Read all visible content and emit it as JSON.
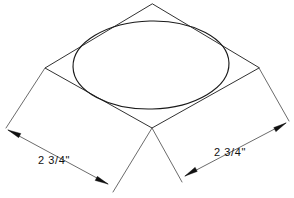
{
  "drawing": {
    "title": "Isometric square with inscribed circle",
    "background_color": "#ffffff",
    "line_color": "#1a1a1a",
    "dimension_line_color": "#3a3a3a",
    "text_color": "#111111",
    "canvas": {
      "width": 294,
      "height": 198
    }
  },
  "shape": {
    "name": "isometric-square",
    "type": "rhombus",
    "vertices": {
      "top": {
        "x": 152,
        "y": 4
      },
      "left": {
        "x": 45,
        "y": 68
      },
      "bottom": {
        "x": 152,
        "y": 128
      },
      "right": {
        "x": 259,
        "y": 68
      }
    },
    "path": "M 152 4 L 45 68 L 152 128 L 259 68 Z"
  },
  "inscribed_circle": {
    "name": "isometric-circle",
    "type": "ellipse",
    "center": {
      "x": 151,
      "y": 65
    },
    "radius_x": 78,
    "radius_y": 44,
    "rotation_deg": -1.5
  },
  "dimensions": [
    {
      "id": "left",
      "label": "2 3/4\"",
      "extension_from": {
        "x": 45,
        "y": 68
      },
      "extension_to": {
        "x": 6,
        "y": 128
      },
      "extension2_from": {
        "x": 152,
        "y": 128
      },
      "extension2_to": {
        "x": 113,
        "y": 192
      },
      "arrow_start": {
        "x": 8,
        "y": 130
      },
      "arrow_end": {
        "x": 108,
        "y": 184
      },
      "text_position": {
        "x": 38,
        "y": 164
      }
    },
    {
      "id": "right",
      "label": "2 3/4\"",
      "extension_from": {
        "x": 259,
        "y": 68
      },
      "extension_to": {
        "x": 289,
        "y": 121
      },
      "extension2_from": {
        "x": 152,
        "y": 128
      },
      "extension2_to": {
        "x": 182,
        "y": 182
      },
      "arrow_start": {
        "x": 286,
        "y": 123
      },
      "arrow_end": {
        "x": 185,
        "y": 176
      },
      "text_position": {
        "x": 214,
        "y": 156
      }
    }
  ]
}
